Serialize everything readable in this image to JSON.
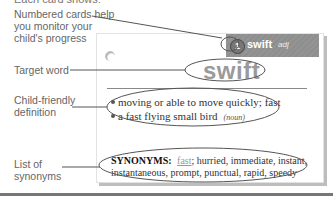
{
  "caption": "Each card shows:",
  "labels": {
    "numbered_cards": "Numbered cards help you monitor your child's progress",
    "target_word": "Target word",
    "definition": "Child-friendly definition",
    "synonyms": "List of synonyms"
  },
  "card": {
    "number": "1",
    "header_word": "swift",
    "part_of_speech": "adj",
    "target_word": "swift",
    "definitions": [
      {
        "text": "moving or able to move quickly; fast",
        "pos": ""
      },
      {
        "text": "a fast flying small bird",
        "pos": "(noun)"
      }
    ],
    "synonyms_label": "SYNONYMS:",
    "synonyms_highlight": "fast",
    "synonyms_rest": "; hurried, immediate, instant, instantaneous, prompt, punctual, rapid, speedy"
  },
  "colors": {
    "header_bg": "#919191",
    "target_word": "#9a9a9a",
    "callout_line": "#555555"
  }
}
